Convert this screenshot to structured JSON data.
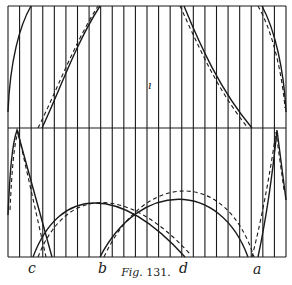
{
  "figure": {
    "caption_prefix": "Fig.",
    "caption_number": "131.",
    "ink_color": "#1a1a1a",
    "background": "#ffffff",
    "frame": {
      "left": 8,
      "right": 286,
      "top": 6,
      "middle": 128,
      "bottom": 257
    },
    "vertical_lines": {
      "count": 25,
      "x_start": 8,
      "x_end": 286
    },
    "point_labels": [
      {
        "id": "c",
        "text": "c",
        "x": 28,
        "y": 261
      },
      {
        "id": "b",
        "text": "b",
        "x": 98,
        "y": 261
      },
      {
        "id": "d",
        "text": "d",
        "x": 179,
        "y": 261
      },
      {
        "id": "a",
        "text": "a",
        "x": 253,
        "y": 262
      }
    ],
    "stray_mark": {
      "text": "ı",
      "x": 148,
      "y": 80
    }
  },
  "chart_data": {
    "type": "diagram",
    "title": "Fig. 131.",
    "upper_band": {
      "solid_curves": [
        "M8,112 C10,60 20,25 31,6",
        "M42,128 C60,90 75,45 100,6",
        "M184,6 C200,45 220,90 252,128",
        "M262,6 C275,30 284,70 286,112"
      ],
      "dashed_curves": [
        "M38,128 C58,88 74,44 98,6",
        "M180,6 C198,45 216,88 248,128",
        "M258,6 C272,30 282,72 285,108"
      ]
    },
    "lower_band": {
      "solid_curves": [
        "M8,215 C10,170 12,145 17,130 L52,257",
        "M33,257 C60,185 120,185 185,257",
        "M100,257 C140,180 220,180 248,257",
        "M258,257 C268,210 274,160 277,130 L286,200"
      ],
      "dashed_curves": [
        "M10,210 C12,168 14,145 18,132 L46,257",
        "M38,257 C66,186 126,184 190,254",
        "M104,257 C144,170 226,168 254,257",
        "M252,257 C264,210 272,160 276,132 L284,190"
      ]
    },
    "labels": [
      "c",
      "b",
      "d",
      "a"
    ]
  }
}
